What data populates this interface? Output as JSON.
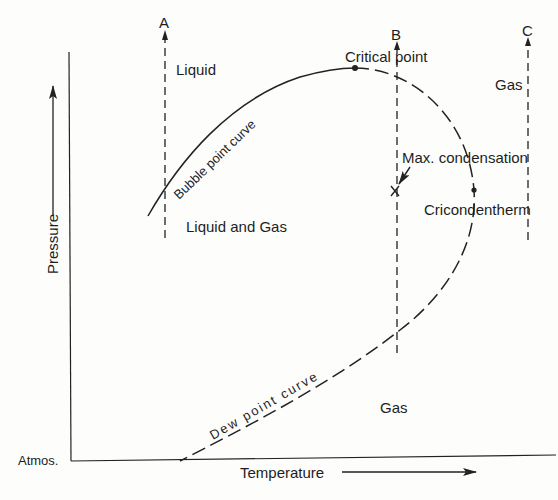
{
  "figure": {
    "type": "phase-diagram"
  },
  "axes": {
    "y_label": "Pressure",
    "x_label": "Temperature",
    "origin_label": "Atmos."
  },
  "regions": {
    "liquid": "Liquid",
    "two_phase": "Liquid and Gas",
    "gas_upper_right": "Gas",
    "gas_lower": "Gas"
  },
  "curves": {
    "bubble_point": "Bubble point curve",
    "dew_point": "Dew point curve"
  },
  "points": {
    "critical": "Critical point",
    "cricondentherm": "Cricondentherm",
    "max_condensation": "Max. condensation"
  },
  "isotherms": [
    {
      "id": "A",
      "label": "A"
    },
    {
      "id": "B",
      "label": "B"
    },
    {
      "id": "C",
      "label": "C"
    }
  ],
  "colors": {
    "ink": "#222222",
    "paper": "#fdfdfb"
  }
}
